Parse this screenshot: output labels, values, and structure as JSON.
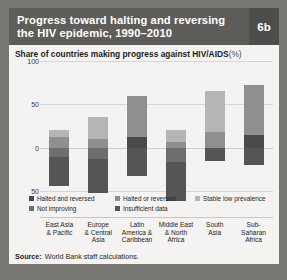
{
  "header": {
    "title_line1": "Progress toward halting and reversing",
    "title_line2": "the HIV epidemic, 1990–2010",
    "figure_number": "6b"
  },
  "subtitle": {
    "text": "Share of countries making progress against HIV/AIDS",
    "unit": "(%)"
  },
  "source": {
    "label": "Source:",
    "text": "World Bank staff calculations."
  },
  "chart_data": {
    "type": "bar",
    "variant": "diverging-stacked",
    "title": "Progress toward halting and reversing the HIV epidemic, 1990–2010",
    "subtitle": "Share of countries making progress against HIV/AIDS (%)",
    "xlabel": "",
    "ylabel": "",
    "ylim": [
      -50,
      100
    ],
    "yticks": [
      100,
      50,
      0,
      -50
    ],
    "ytick_labels": [
      "100",
      "50",
      "0",
      "50"
    ],
    "grid": true,
    "legend_position": "bottom",
    "categories": [
      "East Asia & Pacific",
      "Europe & Central Asia",
      "Latin America & Caribbean",
      "Middle East & North Africa",
      "South Asia",
      "Sub-Saharan Africa"
    ],
    "category_lines": [
      [
        "East Asia",
        "& Pacific"
      ],
      [
        "Europe",
        "& Central",
        "Asia"
      ],
      [
        "Latin",
        "America &",
        "Caribbean"
      ],
      [
        "Middle East",
        "& North",
        "Africa"
      ],
      [
        "South",
        "Asia"
      ],
      [
        "Sub-Saharan",
        "Africa"
      ]
    ],
    "series": [
      {
        "name": "Halted and reversed",
        "color": "#4a4a4a",
        "direction": "up",
        "values": [
          0,
          0,
          12,
          0,
          0,
          15
        ]
      },
      {
        "name": "Halted or reversed",
        "color": "#8f8f8f",
        "direction": "up",
        "values": [
          12,
          10,
          48,
          6,
          18,
          57
        ]
      },
      {
        "name": "Stable low prevalence",
        "color": "#b5b5b5",
        "direction": "up",
        "values": [
          8,
          25,
          0,
          14,
          47,
          0
        ]
      },
      {
        "name": "Not improving",
        "color": "#6e6e6e",
        "direction": "down",
        "values": [
          11,
          13,
          0,
          16,
          0,
          0
        ]
      },
      {
        "name": "Insufficient data",
        "color": "#555555",
        "direction": "down",
        "values": [
          33,
          39,
          33,
          45,
          15,
          20
        ]
      }
    ]
  },
  "legend": {
    "rows": [
      [
        {
          "label": "Halted and reversed",
          "color": "#4a4a4a"
        },
        {
          "label": "Halted or reversed",
          "color": "#8f8f8f"
        },
        {
          "label": "Stable low prevalence",
          "color": "#b5b5b5"
        }
      ],
      [
        {
          "label": "Not improving",
          "color": "#6e6e6e"
        },
        {
          "label": "Insufficient data",
          "color": "#555555"
        }
      ]
    ]
  }
}
